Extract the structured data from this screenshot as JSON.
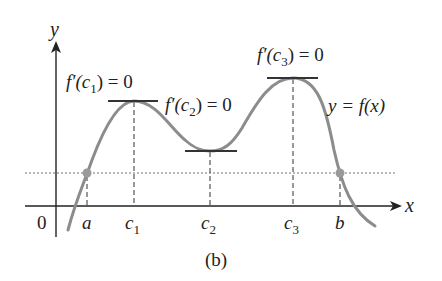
{
  "figure": {
    "caption": "(b)",
    "axes": {
      "x_label": "x",
      "y_label": "y",
      "origin_label": "0"
    },
    "curve_label": "y = f(x)",
    "tick_labels": {
      "a": "a",
      "c1": "c",
      "c1_sub": "1",
      "c2": "c",
      "c2_sub": "2",
      "c3": "c",
      "c3_sub": "3",
      "b": "b"
    },
    "annotations": {
      "c1": {
        "prefix": "f′(c",
        "sub": "1",
        "suffix": ") = 0"
      },
      "c2": {
        "prefix": "f′(c",
        "sub": "2",
        "suffix": ") = 0"
      },
      "c3": {
        "prefix": "f′(c",
        "sub": "3",
        "suffix": ") = 0"
      }
    },
    "colors": {
      "axis": "#222222",
      "curve": "#8c8c8c",
      "tangent": "#333333",
      "dashed": "#333333",
      "dotted_level": "#b8b8b8",
      "points": "#9a9a9a"
    }
  }
}
